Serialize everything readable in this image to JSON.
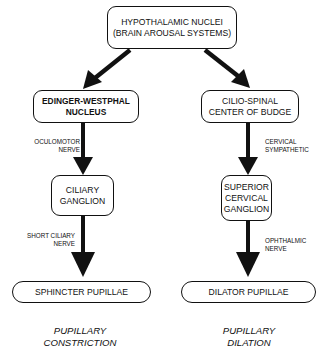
{
  "diagram": {
    "top": {
      "line1": "HYPOTHALAMIC NUCLEI",
      "line2": "(BRAIN AROUSAL SYSTEMS)"
    },
    "left": {
      "nucleus": {
        "line1": "EDINGER-WESTPHAL",
        "line2": "NUCLEUS"
      },
      "nerve1": {
        "line1": "OCULOMOTOR",
        "line2": "NERVE"
      },
      "ganglion": {
        "line1": "CILIARY",
        "line2": "GANGLION"
      },
      "nerve2": {
        "line1": "SHORT CILIARY",
        "line2": "NERVE"
      },
      "effector": "SPHINCTER PUPILLAE",
      "outcome": {
        "line1": "PUPILLARY",
        "line2": "CONSTRICTION"
      }
    },
    "right": {
      "nucleus": {
        "line1": "CILIO-SPINAL",
        "line2": "CENTER OF BUDGE"
      },
      "nerve1": {
        "line1": "CERVICAL",
        "line2": "SYMPATHETIC"
      },
      "ganglion": {
        "line1": "SUPERIOR",
        "line2": "CERVICAL",
        "line3": "GANGLION"
      },
      "nerve2": {
        "line1": "OPHTHALMIC",
        "line2": "NERVE"
      },
      "effector": "DILATOR PUPILLAE",
      "outcome": {
        "line1": "PUPILLARY",
        "line2": "DILATION"
      }
    }
  }
}
